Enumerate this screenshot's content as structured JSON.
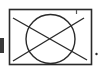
{
  "figure": {
    "symbol": "crossed-out-circle-in-box",
    "stroke_color": "#2a2a2a",
    "left_bar_color": "#3a3a3a",
    "trailing_mark": "."
  }
}
